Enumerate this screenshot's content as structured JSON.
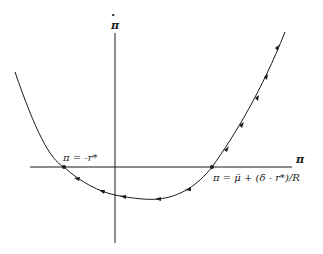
{
  "diagram": {
    "type": "phase-diagram",
    "axes": {
      "y_label": "π̇",
      "y_label_base": "π",
      "y_label_dot": "•",
      "x_label": "π"
    },
    "equilibria": [
      {
        "id": "left",
        "label": "π = -r*",
        "stability": "stable"
      },
      {
        "id": "right",
        "label": "π = μ̄ + (δ - r*)/R",
        "stability": "unstable"
      }
    ],
    "colors": {
      "line": "#1a1a1a",
      "background": "#ffffff"
    }
  }
}
